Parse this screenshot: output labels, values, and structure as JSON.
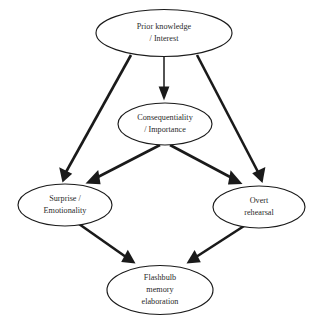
{
  "diagram": {
    "type": "flowchart",
    "background_color": "#ffffff",
    "stroke_color": "#1a1a1a",
    "text_color": "#2b2b2b",
    "nodes": [
      {
        "id": "prior-knowledge",
        "lines": [
          "Prior knowledge",
          "/ Interest"
        ],
        "line1": "Prior knowledge",
        "line2": "/ Interest",
        "cx": 164,
        "cy": 33,
        "rx": 68,
        "ry": 23.5
      },
      {
        "id": "consequentiality",
        "lines": [
          "Consequentiality",
          "/ Importance"
        ],
        "line1": "Consequentiality",
        "line2": "/ Importance",
        "cx": 165,
        "cy": 124,
        "rx": 47,
        "ry": 21
      },
      {
        "id": "surprise",
        "lines": [
          "Surprise /",
          "Emotionality"
        ],
        "line1": "Surprise /",
        "line2": "Emotionality",
        "cx": 65,
        "cy": 205,
        "rx": 47,
        "ry": 21
      },
      {
        "id": "overt-rehearsal",
        "lines": [
          "Overt",
          "rehearsal"
        ],
        "line1": "Overt",
        "line2": "rehearsal",
        "cx": 259,
        "cy": 207,
        "rx": 46,
        "ry": 21
      },
      {
        "id": "flashbulb",
        "lines": [
          "Flashbulb",
          "memory",
          "elaboration"
        ],
        "line1": "Flashbulb",
        "line2": "memory",
        "line3": "elaboration",
        "cx": 160,
        "cy": 290,
        "rx": 53,
        "ry": 24.5
      }
    ],
    "edges": [
      {
        "id": "prior-to-surprise",
        "from": "prior-knowledge",
        "to": "surprise"
      },
      {
        "id": "prior-to-consequentiality",
        "from": "prior-knowledge",
        "to": "consequentiality"
      },
      {
        "id": "prior-to-overt-rehearsal",
        "from": "prior-knowledge",
        "to": "overt-rehearsal"
      },
      {
        "id": "consequentiality-to-surprise",
        "from": "consequentiality",
        "to": "surprise"
      },
      {
        "id": "consequentiality-to-overt-rehearsal",
        "from": "consequentiality",
        "to": "overt-rehearsal"
      },
      {
        "id": "surprise-to-flashbulb",
        "from": "surprise",
        "to": "flashbulb"
      },
      {
        "id": "overt-rehearsal-to-flashbulb",
        "from": "overt-rehearsal",
        "to": "flashbulb"
      }
    ]
  }
}
